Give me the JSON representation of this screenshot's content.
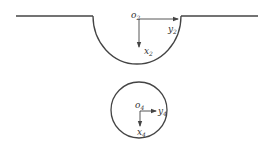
{
  "diagram": {
    "type": "coordinate-frames",
    "colors": {
      "line": "#444444",
      "text": "#333333",
      "background": "#ffffff"
    },
    "surface": {
      "description": "flat surface with semicircular groove",
      "frame": {
        "origin": "o",
        "origin_sub": "2",
        "x_axis": "x",
        "x_sub": "2",
        "y_axis": "y",
        "y_sub": "2"
      }
    },
    "circle": {
      "description": "circular body",
      "frame": {
        "origin": "o",
        "origin_sub": "4",
        "x_axis": "x",
        "x_sub": "4",
        "y_axis": "y",
        "y_sub": "4"
      }
    }
  }
}
